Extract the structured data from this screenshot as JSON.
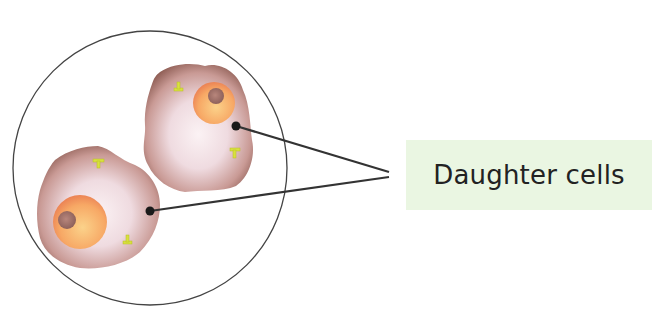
{
  "diagram": {
    "title": "Daughter cells",
    "label": "Daughter cells",
    "colors": {
      "outline": "#333333",
      "cell_body": "#e8c8c8",
      "cell_edge": "#9a6a60",
      "nucleus": "#f5a060",
      "nucleolus": "#a07068",
      "centriole": "#d8e040",
      "label_background": "#eaf6e2",
      "label_text": "#222222"
    },
    "elements": [
      {
        "type": "circle",
        "name": "field-of-view"
      },
      {
        "type": "cell",
        "name": "daughter-cell-upper-right"
      },
      {
        "type": "cell",
        "name": "daughter-cell-lower-left"
      },
      {
        "type": "leader-line",
        "target": "daughter-cell-upper-right"
      },
      {
        "type": "leader-line",
        "target": "daughter-cell-lower-left"
      }
    ]
  }
}
